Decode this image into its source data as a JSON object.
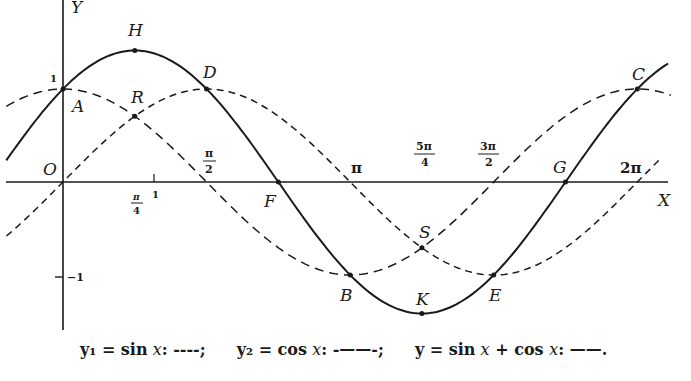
{
  "figure": {
    "axis_labels": {
      "x": "X",
      "y": "Y",
      "origin": "O"
    },
    "y_ticks": [
      {
        "label": "1",
        "value": 1
      },
      {
        "label": "−1",
        "value": -1
      }
    ],
    "x_ticks": [
      {
        "label": "π/4",
        "num": "π",
        "den": "4",
        "value": 0.7854
      },
      {
        "label": "1",
        "value": 1
      },
      {
        "label": "π/2",
        "num": "π",
        "den": "2",
        "value": 1.5708
      },
      {
        "label": "π",
        "value": 3.1416
      },
      {
        "label": "5π/4",
        "num": "5π",
        "den": "4",
        "value": 3.927
      },
      {
        "label": "3π/2",
        "num": "3π",
        "den": "2",
        "value": 4.7124
      },
      {
        "label": "2π",
        "value": 6.2832
      }
    ],
    "points": {
      "A": "A",
      "H": "H",
      "R": "R",
      "D": "D",
      "F": "F",
      "B": "B",
      "K": "K",
      "S": "S",
      "E": "E",
      "G": "G",
      "C": "C"
    },
    "legend": {
      "y1": {
        "lhs": "y₁ = sin",
        "var": "x",
        "style": ": ----;"
      },
      "y2": {
        "lhs": "y₂ = cos",
        "var": "x",
        "style": ": -——-;"
      },
      "y": {
        "lhs": "y = sin",
        "var": "x",
        "mid": " + cos ",
        "var2": "x",
        "style": ": ——."
      }
    }
  },
  "chart_data": {
    "type": "line",
    "title": "",
    "xlabel": "X",
    "ylabel": "Y",
    "xlim": [
      -0.68,
      6.9
    ],
    "ylim": [
      -1.5,
      1.9
    ],
    "grid": false,
    "series": [
      {
        "name": "y1 = sin x",
        "style": "short dashed",
        "x": [
          -0.7,
          0,
          0.7854,
          1.5708,
          2.3562,
          3.1416,
          3.927,
          4.7124,
          5.4978,
          6.2832,
          6.6
        ],
        "values": [
          -0.644,
          0,
          0.707,
          1,
          0.707,
          0,
          -0.707,
          -1,
          -0.707,
          0,
          0.312
        ]
      },
      {
        "name": "y2 = cos x",
        "style": "long dash-dot",
        "x": [
          -0.6,
          0,
          0.7854,
          1.5708,
          2.3562,
          3.1416,
          3.927,
          4.7124,
          5.4978,
          6.2832,
          6.6
        ],
        "values": [
          0.825,
          1,
          0.707,
          0,
          -0.707,
          -1,
          -0.707,
          0,
          0.707,
          1,
          0.95
        ]
      },
      {
        "name": "y = sin x + cos x",
        "style": "solid",
        "x": [
          -0.6,
          0,
          0.7854,
          1.5708,
          2.3562,
          3.1416,
          3.927,
          4.7124,
          5.4978,
          6.2832,
          6.6
        ],
        "values": [
          0.261,
          1,
          1.414,
          1,
          0,
          -1,
          -1.414,
          -1,
          0,
          1,
          1.261
        ]
      }
    ],
    "annotations": [
      {
        "label": "O",
        "x": 0,
        "y": 0
      },
      {
        "label": "A",
        "x": 0,
        "y": 1
      },
      {
        "label": "H",
        "x": 0.7854,
        "y": 1.414
      },
      {
        "label": "R",
        "x": 0.7854,
        "y": 0.707
      },
      {
        "label": "D",
        "x": 1.5708,
        "y": 1
      },
      {
        "label": "F",
        "x": 2.3562,
        "y": 0
      },
      {
        "label": "B",
        "x": 3.1416,
        "y": -1
      },
      {
        "label": "S",
        "x": 3.927,
        "y": -0.707
      },
      {
        "label": "K",
        "x": 3.927,
        "y": -1.414
      },
      {
        "label": "E",
        "x": 4.7124,
        "y": -1
      },
      {
        "label": "G",
        "x": 5.4978,
        "y": 0
      },
      {
        "label": "C",
        "x": 6.2832,
        "y": 1
      }
    ],
    "legend": [
      "y1 = sin x: ----;",
      "y2 = cos x: -——-;",
      "y = sin x + cos x: ——."
    ]
  }
}
